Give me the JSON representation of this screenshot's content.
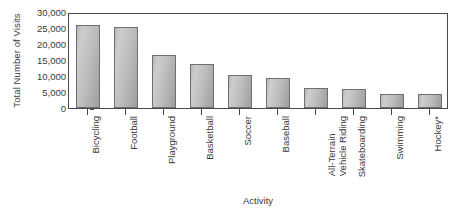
{
  "chart_data": {
    "type": "bar",
    "title": "",
    "xlabel": "Activity",
    "ylabel": "Total Number of Visits",
    "ylim": [
      0,
      30000
    ],
    "yticks": [
      "0",
      "5,000",
      "10,000",
      "15,000",
      "20,000",
      "25,000",
      "30,000"
    ],
    "ytick_values": [
      0,
      5000,
      10000,
      15000,
      20000,
      25000,
      30000
    ],
    "grid": false,
    "legend": null,
    "categories": [
      "Bicycling",
      "Football",
      "Playground",
      "Basketball",
      "Soccer",
      "Baseball",
      "All-Terrain Vehicle Riding",
      "Skateboarding",
      "Swimming",
      "Hockey*"
    ],
    "category_lines": [
      [
        "Bicycling"
      ],
      [
        "Football"
      ],
      [
        "Playground"
      ],
      [
        "Basketball"
      ],
      [
        "Soccer"
      ],
      [
        "Baseball"
      ],
      [
        "All-Terrain",
        "Vehicle Riding"
      ],
      [
        "Skateboarding"
      ],
      [
        "Swimming"
      ],
      [
        "Hockey*"
      ]
    ],
    "values": [
      26000,
      25200,
      16600,
      13800,
      10400,
      9500,
      6200,
      5900,
      4500,
      4400
    ],
    "bar_color": "#bdbdbd",
    "bar_edge_color": "#6f6f6f",
    "axis_color": "#4a4a4a",
    "text_color": "#3a3a3a",
    "background": "#ffffff"
  }
}
